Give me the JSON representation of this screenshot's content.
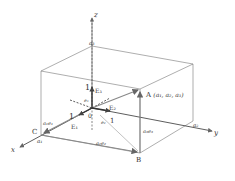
{
  "diagram": {
    "type": "3d-coordinate-box",
    "axes": {
      "x": "x",
      "y": "y",
      "z": "z"
    },
    "origin": "0",
    "points": {
      "A": "A",
      "A_coords": "(a₁, a₂, a₃)",
      "B": "B",
      "C": "C"
    },
    "unit_vectors": {
      "E1": "E₁",
      "E2": "E₂",
      "E3": "E₃",
      "e1": "e₁",
      "e2": "e₂",
      "e3": "e₃"
    },
    "unit_marks": {
      "x": "1",
      "y": "1",
      "z": "1"
    },
    "axis_intercepts": {
      "x": "a₁",
      "y": "a₂",
      "z": "a₃"
    },
    "component_labels": {
      "a1e1": "a₁e₁",
      "a2e2": "a₂e₂",
      "a3e3": "a₃e₃"
    },
    "colors": {
      "line": "#555555",
      "vector": "#888888",
      "text": "#333333"
    }
  }
}
